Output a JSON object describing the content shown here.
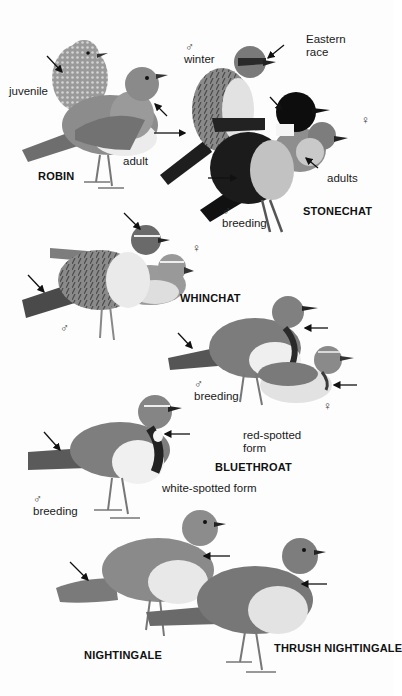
{
  "plate": {
    "species": [
      {
        "name": "ROBIN",
        "labels": [
          "juvenile",
          "adult"
        ]
      },
      {
        "name": "STONECHAT",
        "labels": [
          "winter",
          "Eastern race",
          "adults",
          "breeding"
        ]
      },
      {
        "name": "WHINCHAT",
        "labels": []
      },
      {
        "name": "BLUETHROAT",
        "labels": [
          "breeding",
          "red-spotted form",
          "breeding",
          "white-spotted form"
        ]
      },
      {
        "name": "NIGHTINGALE",
        "labels": []
      },
      {
        "name": "THRUSH NIGHTINGALE",
        "labels": []
      }
    ],
    "symbols": {
      "male": "♂",
      "female": "♀"
    },
    "text": {
      "robin_juvenile": "juvenile",
      "robin_adult": "adult",
      "robin_name": "ROBIN",
      "stonechat_winter": "winter",
      "stonechat_eastern_1": "Eastern",
      "stonechat_eastern_2": "race",
      "stonechat_adults": "adults",
      "stonechat_breeding": "breeding",
      "stonechat_name": "STONECHAT",
      "whinchat_name": "WHINCHAT",
      "bluethroat_red_breeding": "breeding",
      "bluethroat_red_form_1": "red-spotted",
      "bluethroat_red_form_2": "form",
      "bluethroat_name": "BLUETHROAT",
      "bluethroat_white_form": "white-spotted form",
      "bluethroat_white_breeding": "breeding",
      "nightingale_name": "NIGHTINGALE",
      "thrush_nightingale_name": "THRUSH NIGHTINGALE"
    }
  }
}
